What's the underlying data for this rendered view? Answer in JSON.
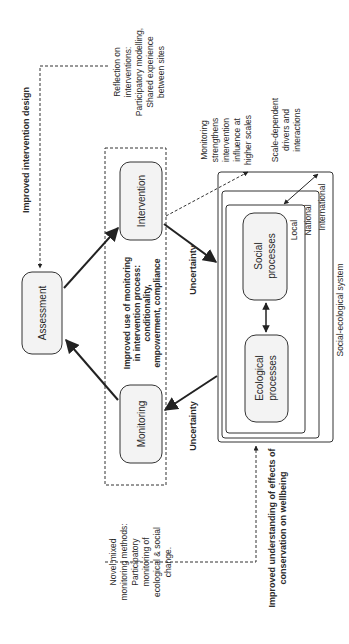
{
  "diagram": {
    "nodes": {
      "assessment": "Assessment",
      "intervention": "Intervention",
      "monitoring": "Monitoring",
      "social": [
        "Social",
        "processes"
      ],
      "ecological": [
        "Ecological",
        "processes"
      ]
    },
    "scales": {
      "local": "Local",
      "national": "National",
      "international": "International"
    },
    "system_label": "Social-ecological system",
    "uncertainty_top": "Uncertainty",
    "uncertainty_bottom": "Uncertainty",
    "improved_intervention_design": "Improved intervention design",
    "improved_monitoring_use": [
      "Improved use of monitoring",
      "in intervention process:",
      "conditionality,",
      "empowerment, compliance"
    ],
    "reflection": [
      "Reflection on",
      "interventions:",
      "Participatory modelling,",
      "Shared experience",
      "between sites"
    ],
    "monitoring_strengthens": [
      "Monitoring",
      "strengthens",
      "intervention",
      "influence at",
      "higher scales"
    ],
    "scale_dependent": [
      "Scale-dependent",
      "drivers and",
      "interactions"
    ],
    "improved_understanding": [
      "Improved understanding of effects of",
      "conservation on wellbeing"
    ],
    "novel_methods": [
      "Novel mixed",
      "monitoring methods:",
      "Participatory",
      "monitoring of",
      "ecological & social",
      "change."
    ]
  },
  "colors": {
    "stroke": "#333333",
    "box_fill": "#f3f3f3",
    "text": "#2a2a2a"
  }
}
